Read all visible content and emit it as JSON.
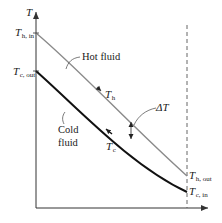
{
  "diagram": {
    "axes": {
      "y_label": "T",
      "x_label": ""
    },
    "hot_fluid": {
      "label": "Hot fluid",
      "curve_label_main": "T",
      "curve_label_sub": "h",
      "inlet_main": "T",
      "inlet_sub": "h, in",
      "outlet_main": "T",
      "outlet_sub": "h, out",
      "color": "#8a8a8a"
    },
    "cold_fluid": {
      "label_line1": "Cold",
      "label_line2": "fluid",
      "curve_label_main": "T",
      "curve_label_sub": "c",
      "inlet_main": "T",
      "inlet_sub": "c, in",
      "outlet_main": "T",
      "outlet_sub": "c, out",
      "color": "#111111"
    },
    "delta_t": {
      "label": "ΔT"
    }
  }
}
